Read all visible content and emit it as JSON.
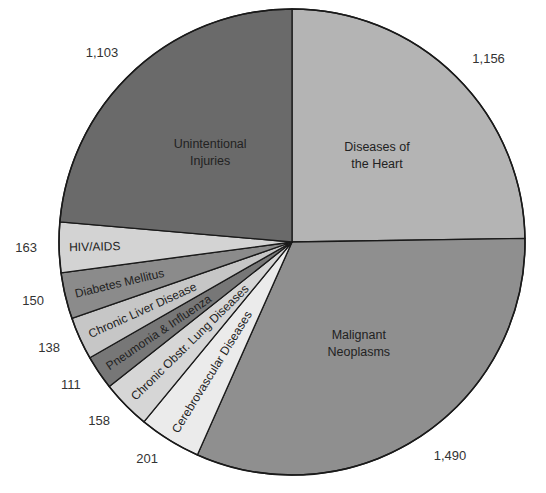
{
  "chart_data": {
    "type": "pie",
    "title": "",
    "start": "12 o'clock",
    "direction": "clockwise",
    "slices": [
      {
        "label": "Diseases of the Heart",
        "label_lines": [
          "Diseases of",
          "the Heart"
        ],
        "value": 1156,
        "value_label": "1,156",
        "color": "#b4b4b4",
        "label_style": "center"
      },
      {
        "label": "Malignant Neoplasms",
        "label_lines": [
          "Malignant",
          "Neoplasms"
        ],
        "value": 1490,
        "value_label": "1,490",
        "color": "#8f8f8f",
        "label_style": "center"
      },
      {
        "label": "Cerebrovascular Diseases",
        "label_lines": [
          "Cerebrovascular Diseases"
        ],
        "value": 201,
        "value_label": "201",
        "color": "#ebebeb",
        "label_style": "radial"
      },
      {
        "label": "Chronic Obstr. Lung Diseases",
        "label_lines": [
          "Chronic Obstr. Lung Diseases"
        ],
        "value": 158,
        "value_label": "158",
        "color": "#d6d6d6",
        "label_style": "radial"
      },
      {
        "label": "Pneumonia & Influenza",
        "label_lines": [
          "Pneumonia & Influenza"
        ],
        "value": 111,
        "value_label": "111",
        "color": "#777777",
        "label_style": "radial"
      },
      {
        "label": "Chronic Liver Disease",
        "label_lines": [
          "Chronic Liver Disease"
        ],
        "value": 138,
        "value_label": "138",
        "color": "#c6c6c6",
        "label_style": "radial"
      },
      {
        "label": "Diabetes Mellitus",
        "label_lines": [
          "Diabetes Mellitus"
        ],
        "value": 150,
        "value_label": "150",
        "color": "#8b8b8b",
        "label_style": "radial"
      },
      {
        "label": "HIV/AIDS",
        "label_lines": [
          "HIV/AIDS"
        ],
        "value": 163,
        "value_label": "163",
        "color": "#d3d3d3",
        "label_style": "radial"
      },
      {
        "label": "Unintentional Injuries",
        "label_lines": [
          "Unintentional",
          "Injuries"
        ],
        "value": 1103,
        "value_label": "1,103",
        "color": "#6a6a6a",
        "label_style": "center"
      }
    ]
  }
}
